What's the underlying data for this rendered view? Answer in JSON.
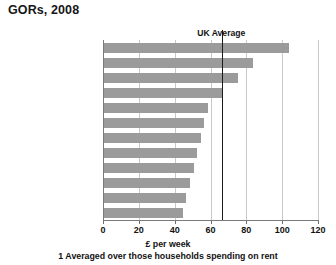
{
  "title": "GORs, 2008",
  "chart_data": {
    "type": "bar",
    "orientation": "horizontal",
    "title": "GORs, 2008",
    "xlabel": "£ per week",
    "ylabel": "",
    "xlim": [
      0,
      120
    ],
    "xticks": [
      0,
      20,
      40,
      60,
      80,
      100,
      120
    ],
    "grid": true,
    "legend": null,
    "categories": [
      "London",
      "South East",
      "East",
      "South West",
      "East Midlands",
      "Yorks & the Humber",
      "Wales",
      "Scotland",
      "West Midlands",
      "Northern Ireland",
      "North West",
      "North East"
    ],
    "values": [
      103,
      83,
      75,
      66,
      58,
      56,
      54,
      52,
      50,
      48,
      46,
      44
    ],
    "annotations": [
      {
        "label": "UK Average",
        "value": 66,
        "type": "vertical-reference-line"
      }
    ],
    "bar_color": "#9b9b9b",
    "reference_line_color": "#1b1b1b"
  },
  "footnote": "1 Averaged over those households spending on rent"
}
